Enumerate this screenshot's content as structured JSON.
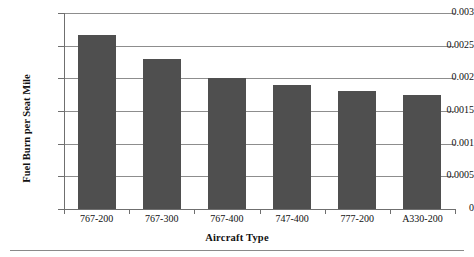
{
  "chart_data": {
    "type": "bar",
    "title": "",
    "xlabel": "Aircraft Type",
    "ylabel": "Fuel Burn per Seat Mile",
    "categories": [
      "767-200",
      "767-300",
      "767-400",
      "747-400",
      "777-200",
      "A330-200"
    ],
    "values": [
      0.00267,
      0.0023,
      0.002,
      0.0019,
      0.0018,
      0.00175
    ],
    "ylim": [
      0,
      0.003
    ],
    "ytick_labels": [
      "0",
      "0.0005",
      "0.001",
      "0.0015",
      "0.002",
      "0.0025",
      "0.003"
    ],
    "ytick_values": [
      0,
      0.0005,
      0.001,
      0.0015,
      0.002,
      0.0025,
      0.003
    ],
    "grid": true,
    "legend": false,
    "bar_color": "#4f4f4f",
    "axis_color": "#6f6f6f",
    "grid_color": "#8d8d8d",
    "background": "#ffffff"
  }
}
